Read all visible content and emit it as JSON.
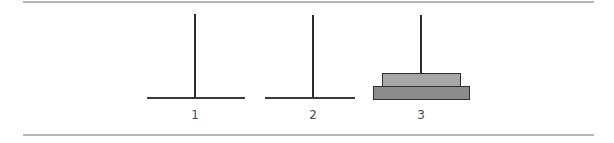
{
  "game": {
    "name": "Tower of Hanoi",
    "pegs": [
      {
        "label": "1",
        "disks": []
      },
      {
        "label": "2",
        "disks": []
      },
      {
        "label": "3",
        "disks": [
          "large",
          "small"
        ]
      }
    ],
    "disks": {
      "small": {
        "size": 1,
        "color": "#a6a6a6"
      },
      "large": {
        "size": 2,
        "color": "#8c8c8c"
      }
    },
    "colors": {
      "pole": "#2b2b2b",
      "border": "#2e2e2e",
      "rule": "#b5b5b5"
    }
  }
}
